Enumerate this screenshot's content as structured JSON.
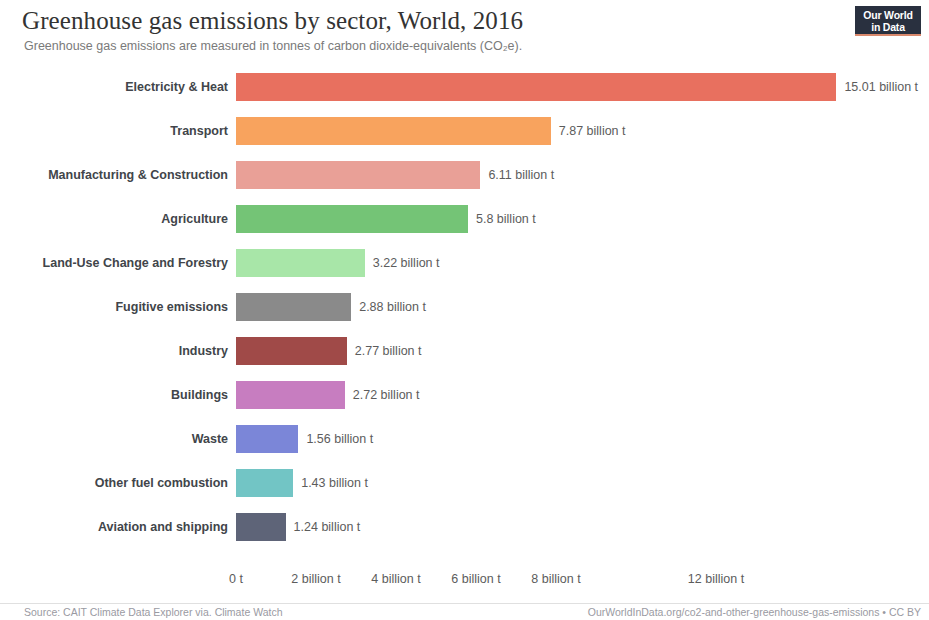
{
  "header": {
    "title": "Greenhouse gas emissions by sector, World, 2016",
    "subtitle": "Greenhouse gas emissions are measured in tonnes of carbon dioxide-equivalents (CO₂e)."
  },
  "logo": {
    "line1": "Our World",
    "line2": "in Data",
    "background": "#29303f",
    "accent": "#d9896d"
  },
  "footer": {
    "source": "Source: CAIT Climate Data Explorer via. Climate Watch",
    "license": "OurWorldInData.org/co2-and-other-greenhouse-gas-emissions • CC BY"
  },
  "chart_data": {
    "type": "bar",
    "orientation": "horizontal",
    "title": "Greenhouse gas emissions by sector, World, 2016",
    "subtitle": "Greenhouse gas emissions are measured in tonnes of carbon dioxide-equivalents (CO₂e).",
    "xlabel": "",
    "ylabel": "",
    "unit": "billion tonnes CO₂e",
    "xlim": [
      0,
      15.5
    ],
    "grid": false,
    "legend": "none",
    "categories": [
      "Electricity & Heat",
      "Transport",
      "Manufacturing & Construction",
      "Agriculture",
      "Land-Use Change and Forestry",
      "Fugitive emissions",
      "Industry",
      "Buildings",
      "Waste",
      "Other fuel combustion",
      "Aviation and shipping"
    ],
    "values": [
      15.01,
      7.87,
      6.11,
      5.8,
      3.22,
      2.88,
      2.77,
      2.72,
      1.56,
      1.43,
      1.24
    ],
    "value_labels": [
      "15.01 billion t",
      "7.87 billion t",
      "6.11 billion t",
      "5.8 billion t",
      "3.22 billion t",
      "2.88 billion t",
      "2.77 billion t",
      "2.72 billion t",
      "1.56 billion t",
      "1.43 billion t",
      "1.24 billion t"
    ],
    "colors": [
      "#e8705f",
      "#f8a35e",
      "#e9a097",
      "#74c476",
      "#a8e6a8",
      "#8a8a8a",
      "#a04a48",
      "#c77dc0",
      "#7b86d8",
      "#72c5c5",
      "#5e6478"
    ],
    "xticks": [
      0,
      2,
      4,
      6,
      8,
      12
    ],
    "xtick_labels": [
      "0 t",
      "2 billion t",
      "4 billion t",
      "6 billion t",
      "8 billion t",
      "12 billion t"
    ]
  },
  "axis_geometry": {
    "origin_x": 236,
    "px_per_unit": 40
  }
}
